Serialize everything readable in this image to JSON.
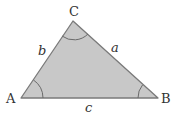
{
  "diagram": {
    "vertices": [
      {
        "id": "A",
        "label": "A",
        "x": 21,
        "y": 98
      },
      {
        "id": "B",
        "label": "B",
        "x": 158,
        "y": 98
      },
      {
        "id": "C",
        "label": "C",
        "x": 73,
        "y": 21
      }
    ],
    "sides": [
      {
        "id": "a",
        "label": "a",
        "from": "B",
        "to": "C"
      },
      {
        "id": "b",
        "label": "b",
        "from": "A",
        "to": "C"
      },
      {
        "id": "c",
        "label": "c",
        "from": "A",
        "to": "B"
      }
    ],
    "angle_markers": [
      "A",
      "B",
      "C"
    ],
    "colors": {
      "fill": "#c8c8c8",
      "stroke": "#7a7a7a",
      "arc": "#6a6a6a",
      "text": "#333333"
    }
  }
}
